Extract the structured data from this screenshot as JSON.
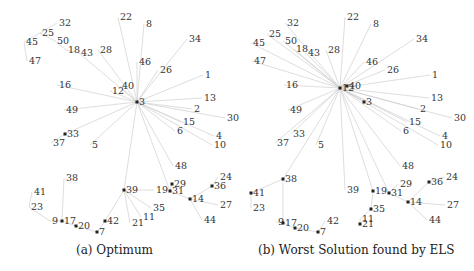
{
  "figures": [
    {
      "id": "a",
      "caption": "(a) Optimum",
      "hub": {
        "label": "3",
        "x": 137,
        "y": 102
      },
      "nodes": [
        {
          "label": "32",
          "x": 57,
          "y": 23,
          "dot": false
        },
        {
          "label": "25",
          "x": 40,
          "y": 33,
          "dot": false
        },
        {
          "label": "45",
          "x": 24,
          "y": 42,
          "dot": false
        },
        {
          "label": "50",
          "x": 55,
          "y": 41,
          "dot": false
        },
        {
          "label": "18",
          "x": 66,
          "y": 50,
          "dot": false
        },
        {
          "label": "43",
          "x": 79,
          "y": 53,
          "dot": false
        },
        {
          "label": "47",
          "x": 27,
          "y": 61,
          "dot": false
        },
        {
          "label": "28",
          "x": 98,
          "y": 50,
          "dot": false
        },
        {
          "label": "22",
          "x": 118,
          "y": 17,
          "dot": false
        },
        {
          "label": "8",
          "x": 144,
          "y": 24,
          "dot": false
        },
        {
          "label": "46",
          "x": 137,
          "y": 62,
          "dot": false
        },
        {
          "label": "34",
          "x": 187,
          "y": 39,
          "dot": false
        },
        {
          "label": "26",
          "x": 158,
          "y": 70,
          "dot": false
        },
        {
          "label": "1",
          "x": 203,
          "y": 75,
          "dot": false
        },
        {
          "label": "16",
          "x": 57,
          "y": 85,
          "dot": false
        },
        {
          "label": "40",
          "x": 120,
          "y": 86,
          "dot": false
        },
        {
          "label": "12",
          "x": 110,
          "y": 91,
          "dot": false
        },
        {
          "label": "13",
          "x": 202,
          "y": 98,
          "dot": false
        },
        {
          "label": "49",
          "x": 64,
          "y": 110,
          "dot": false
        },
        {
          "label": "2",
          "x": 192,
          "y": 109,
          "dot": false
        },
        {
          "label": "30",
          "x": 225,
          "y": 118,
          "dot": false
        },
        {
          "label": "15",
          "x": 181,
          "y": 122,
          "dot": false
        },
        {
          "label": "6",
          "x": 175,
          "y": 131,
          "dot": false
        },
        {
          "label": "4",
          "x": 214,
          "y": 136,
          "dot": false
        },
        {
          "label": "10",
          "x": 212,
          "y": 145,
          "dot": false
        },
        {
          "label": "33",
          "x": 65,
          "y": 134,
          "dot": true
        },
        {
          "label": "37",
          "x": 51,
          "y": 143,
          "dot": false
        },
        {
          "label": "5",
          "x": 90,
          "y": 145,
          "dot": false
        },
        {
          "label": "48",
          "x": 173,
          "y": 166,
          "dot": false
        },
        {
          "label": "38",
          "x": 64,
          "y": 178,
          "dot": false
        },
        {
          "label": "41",
          "x": 32,
          "y": 192,
          "dot": false
        },
        {
          "label": "23",
          "x": 29,
          "y": 207,
          "dot": false
        },
        {
          "label": "9",
          "x": 50,
          "y": 221,
          "dot": false
        },
        {
          "label": "17",
          "x": 62,
          "y": 221,
          "dot": true
        },
        {
          "label": "20",
          "x": 76,
          "y": 226,
          "dot": true
        },
        {
          "label": "42",
          "x": 105,
          "y": 221,
          "dot": true
        },
        {
          "label": "7",
          "x": 97,
          "y": 232,
          "dot": true
        },
        {
          "label": "39",
          "x": 124,
          "y": 190,
          "dot": true
        },
        {
          "label": "21",
          "x": 130,
          "y": 223,
          "dot": false
        },
        {
          "label": "11",
          "x": 141,
          "y": 217,
          "dot": false
        },
        {
          "label": "35",
          "x": 151,
          "y": 208,
          "dot": false
        },
        {
          "label": "19",
          "x": 154,
          "y": 190,
          "dot": false
        },
        {
          "label": "29",
          "x": 172,
          "y": 184,
          "dot": true
        },
        {
          "label": "31",
          "x": 170,
          "y": 191,
          "dot": true
        },
        {
          "label": "24",
          "x": 218,
          "y": 177,
          "dot": false
        },
        {
          "label": "36",
          "x": 212,
          "y": 186,
          "dot": true
        },
        {
          "label": "14",
          "x": 190,
          "y": 199,
          "dot": true
        },
        {
          "label": "27",
          "x": 218,
          "y": 205,
          "dot": false
        },
        {
          "label": "44",
          "x": 202,
          "y": 220,
          "dot": false
        }
      ]
    },
    {
      "id": "b",
      "caption": "(b) Worst Solution found by ELS",
      "hub": {
        "label": "12",
        "x": 340,
        "y": 88
      },
      "nodes": [
        {
          "label": "32",
          "x": 285,
          "y": 23,
          "dot": false
        },
        {
          "label": "25",
          "x": 267,
          "y": 34,
          "dot": false
        },
        {
          "label": "45",
          "x": 251,
          "y": 43,
          "dot": false
        },
        {
          "label": "50",
          "x": 283,
          "y": 41,
          "dot": false
        },
        {
          "label": "18",
          "x": 294,
          "y": 49,
          "dot": false
        },
        {
          "label": "43",
          "x": 306,
          "y": 53,
          "dot": false
        },
        {
          "label": "47",
          "x": 252,
          "y": 61,
          "dot": false
        },
        {
          "label": "28",
          "x": 326,
          "y": 50,
          "dot": false
        },
        {
          "label": "22",
          "x": 345,
          "y": 17,
          "dot": false
        },
        {
          "label": "8",
          "x": 371,
          "y": 24,
          "dot": false
        },
        {
          "label": "46",
          "x": 364,
          "y": 62,
          "dot": false
        },
        {
          "label": "34",
          "x": 414,
          "y": 39,
          "dot": false
        },
        {
          "label": "26",
          "x": 385,
          "y": 70,
          "dot": false
        },
        {
          "label": "1",
          "x": 430,
          "y": 75,
          "dot": false
        },
        {
          "label": "16",
          "x": 284,
          "y": 85,
          "dot": false
        },
        {
          "label": "40",
          "x": 347,
          "y": 86,
          "dot": true
        },
        {
          "label": "3",
          "x": 364,
          "y": 102,
          "dot": true
        },
        {
          "label": "13",
          "x": 429,
          "y": 98,
          "dot": false
        },
        {
          "label": "49",
          "x": 288,
          "y": 110,
          "dot": false
        },
        {
          "label": "2",
          "x": 418,
          "y": 109,
          "dot": false
        },
        {
          "label": "30",
          "x": 452,
          "y": 118,
          "dot": false
        },
        {
          "label": "15",
          "x": 407,
          "y": 122,
          "dot": false
        },
        {
          "label": "6",
          "x": 401,
          "y": 131,
          "dot": false
        },
        {
          "label": "4",
          "x": 440,
          "y": 136,
          "dot": false
        },
        {
          "label": "10",
          "x": 438,
          "y": 145,
          "dot": false
        },
        {
          "label": "33",
          "x": 291,
          "y": 134,
          "dot": false
        },
        {
          "label": "37",
          "x": 275,
          "y": 143,
          "dot": false
        },
        {
          "label": "5",
          "x": 316,
          "y": 145,
          "dot": false
        },
        {
          "label": "48",
          "x": 400,
          "y": 166,
          "dot": false
        },
        {
          "label": "38",
          "x": 283,
          "y": 179,
          "dot": true
        },
        {
          "label": "41",
          "x": 251,
          "y": 193,
          "dot": true
        },
        {
          "label": "23",
          "x": 251,
          "y": 208,
          "dot": false
        },
        {
          "label": "9",
          "x": 276,
          "y": 222,
          "dot": false
        },
        {
          "label": "17",
          "x": 283,
          "y": 223,
          "dot": true
        },
        {
          "label": "20",
          "x": 295,
          "y": 228,
          "dot": true
        },
        {
          "label": "42",
          "x": 325,
          "y": 221,
          "dot": false
        },
        {
          "label": "7",
          "x": 318,
          "y": 232,
          "dot": true
        },
        {
          "label": "39",
          "x": 345,
          "y": 190,
          "dot": false
        },
        {
          "label": "21",
          "x": 360,
          "y": 224,
          "dot": true
        },
        {
          "label": "11",
          "x": 360,
          "y": 219,
          "dot": false
        },
        {
          "label": "35",
          "x": 371,
          "y": 209,
          "dot": true
        },
        {
          "label": "19",
          "x": 373,
          "y": 191,
          "dot": true
        },
        {
          "label": "29",
          "x": 398,
          "y": 184,
          "dot": false
        },
        {
          "label": "31",
          "x": 389,
          "y": 193,
          "dot": true
        },
        {
          "label": "24",
          "x": 444,
          "y": 177,
          "dot": false
        },
        {
          "label": "36",
          "x": 429,
          "y": 182,
          "dot": true
        },
        {
          "label": "14",
          "x": 408,
          "y": 202,
          "dot": true
        },
        {
          "label": "27",
          "x": 445,
          "y": 205,
          "dot": false
        },
        {
          "label": "44",
          "x": 427,
          "y": 220,
          "dot": false
        }
      ]
    }
  ],
  "edges": {
    "a": [
      [
        "3",
        "22"
      ],
      [
        "3",
        "8"
      ],
      [
        "3",
        "46"
      ],
      [
        "3",
        "34"
      ],
      [
        "3",
        "26"
      ],
      [
        "3",
        "1"
      ],
      [
        "3",
        "40"
      ],
      [
        "3",
        "12"
      ],
      [
        "3",
        "16"
      ],
      [
        "3",
        "28"
      ],
      [
        "3",
        "43"
      ],
      [
        "3",
        "13"
      ],
      [
        "3",
        "2"
      ],
      [
        "3",
        "30"
      ],
      [
        "3",
        "15"
      ],
      [
        "3",
        "6"
      ],
      [
        "3",
        "4"
      ],
      [
        "3",
        "10"
      ],
      [
        "3",
        "49"
      ],
      [
        "3",
        "33"
      ],
      [
        "3",
        "5"
      ],
      [
        "3",
        "48"
      ],
      [
        "3",
        "39"
      ],
      [
        "3",
        "31"
      ],
      [
        "43",
        "18"
      ],
      [
        "18",
        "50"
      ],
      [
        "50",
        "25"
      ],
      [
        "25",
        "32"
      ],
      [
        "25",
        "45"
      ],
      [
        "45",
        "47"
      ],
      [
        "33",
        "37"
      ],
      [
        "39",
        "42"
      ],
      [
        "42",
        "7"
      ],
      [
        "7",
        "20"
      ],
      [
        "20",
        "17"
      ],
      [
        "17",
        "9"
      ],
      [
        "17",
        "38"
      ],
      [
        "9",
        "23"
      ],
      [
        "23",
        "41"
      ],
      [
        "39",
        "19"
      ],
      [
        "39",
        "35"
      ],
      [
        "39",
        "11"
      ],
      [
        "39",
        "21"
      ],
      [
        "31",
        "29"
      ],
      [
        "31",
        "14"
      ],
      [
        "14",
        "36"
      ],
      [
        "36",
        "24"
      ],
      [
        "14",
        "27"
      ],
      [
        "14",
        "44"
      ]
    ],
    "b": [
      [
        "12",
        "32"
      ],
      [
        "12",
        "25"
      ],
      [
        "12",
        "45"
      ],
      [
        "12",
        "50"
      ],
      [
        "12",
        "18"
      ],
      [
        "12",
        "43"
      ],
      [
        "12",
        "47"
      ],
      [
        "12",
        "28"
      ],
      [
        "12",
        "22"
      ],
      [
        "12",
        "8"
      ],
      [
        "12",
        "46"
      ],
      [
        "12",
        "34"
      ],
      [
        "12",
        "26"
      ],
      [
        "12",
        "1"
      ],
      [
        "12",
        "16"
      ],
      [
        "12",
        "40"
      ],
      [
        "12",
        "3"
      ],
      [
        "12",
        "13"
      ],
      [
        "12",
        "2"
      ],
      [
        "12",
        "30"
      ],
      [
        "12",
        "15"
      ],
      [
        "12",
        "6"
      ],
      [
        "12",
        "4"
      ],
      [
        "12",
        "10"
      ],
      [
        "12",
        "49"
      ],
      [
        "12",
        "33"
      ],
      [
        "12",
        "37"
      ],
      [
        "12",
        "5"
      ],
      [
        "12",
        "48"
      ],
      [
        "12",
        "38"
      ],
      [
        "12",
        "39"
      ],
      [
        "12",
        "19"
      ],
      [
        "12",
        "31"
      ],
      [
        "38",
        "41"
      ],
      [
        "38",
        "17"
      ],
      [
        "17",
        "9"
      ],
      [
        "17",
        "20"
      ],
      [
        "20",
        "7"
      ],
      [
        "7",
        "42"
      ],
      [
        "41",
        "23"
      ],
      [
        "19",
        "35"
      ],
      [
        "35",
        "11"
      ],
      [
        "11",
        "21"
      ],
      [
        "31",
        "29"
      ],
      [
        "31",
        "14"
      ],
      [
        "14",
        "36"
      ],
      [
        "36",
        "24"
      ],
      [
        "14",
        "27"
      ],
      [
        "14",
        "44"
      ]
    ]
  }
}
